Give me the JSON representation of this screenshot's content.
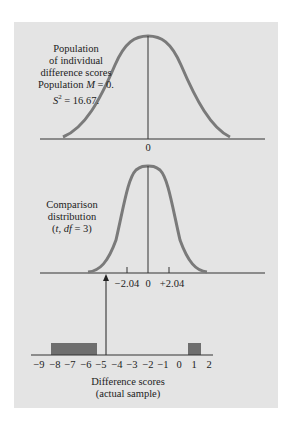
{
  "top_panel": {
    "label_lines": [
      "Population",
      "of individual",
      "difference scores",
      "Population M = 0.",
      "S² = 16.67."
    ],
    "axis_label": "0"
  },
  "middle_panel": {
    "label_lines": [
      "Comparison",
      "distribution",
      "(t, df = 3)"
    ],
    "tick_labels": [
      "−2.04",
      "0",
      "+2.04"
    ]
  },
  "bottom_panel": {
    "tick_labels": [
      "−9",
      "−8",
      "−7",
      "−6",
      "−5",
      "−4",
      "−3",
      "−2",
      "−1",
      "0",
      "1",
      "2"
    ],
    "caption_lines": [
      "Difference scores",
      "(actual sample)"
    ]
  },
  "colors": {
    "panel_bg": "#e4e4e4",
    "curve": "#7a7a7a",
    "bars": "#6e6e6e",
    "axis": "#333333"
  }
}
